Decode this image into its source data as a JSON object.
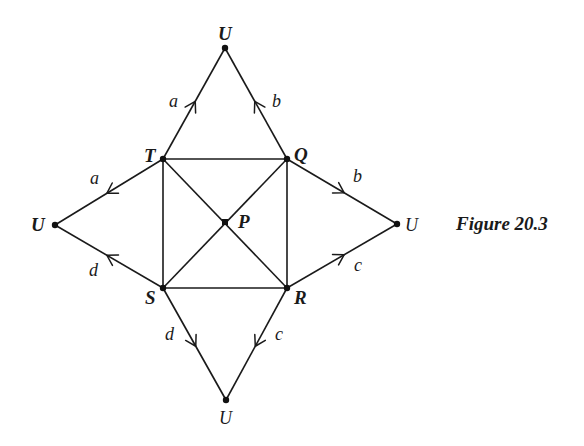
{
  "caption": "Figure 20.3",
  "nodes": [
    {
      "id": "U_top",
      "label": "U"
    },
    {
      "id": "T",
      "label": "T"
    },
    {
      "id": "Q",
      "label": "Q"
    },
    {
      "id": "P",
      "label": "P"
    },
    {
      "id": "U_left",
      "label": "U"
    },
    {
      "id": "U_right",
      "label": "U"
    },
    {
      "id": "S",
      "label": "S"
    },
    {
      "id": "R",
      "label": "R"
    },
    {
      "id": "U_bottom",
      "label": "U"
    }
  ],
  "edges": [
    {
      "from": "T",
      "to": "Q"
    },
    {
      "from": "Q",
      "to": "R"
    },
    {
      "from": "R",
      "to": "S"
    },
    {
      "from": "S",
      "to": "T"
    },
    {
      "from": "T",
      "to": "R"
    },
    {
      "from": "Q",
      "to": "S"
    },
    {
      "from": "T",
      "to": "U_top",
      "label": "a",
      "arrow": "toward U_top"
    },
    {
      "from": "Q",
      "to": "U_top",
      "label": "b",
      "arrow": "toward U_top"
    },
    {
      "from": "T",
      "to": "U_left",
      "label": "a",
      "arrow": "toward U_left"
    },
    {
      "from": "S",
      "to": "U_left",
      "label": "d",
      "arrow": "toward U_left"
    },
    {
      "from": "Q",
      "to": "U_right",
      "label": "b",
      "arrow": "toward U_right"
    },
    {
      "from": "R",
      "to": "U_right",
      "label": "c",
      "arrow": "toward U_right"
    },
    {
      "from": "S",
      "to": "U_bottom",
      "label": "d",
      "arrow": "toward U_bottom"
    },
    {
      "from": "R",
      "to": "U_bottom",
      "label": "c",
      "arrow": "toward U_bottom"
    }
  ]
}
